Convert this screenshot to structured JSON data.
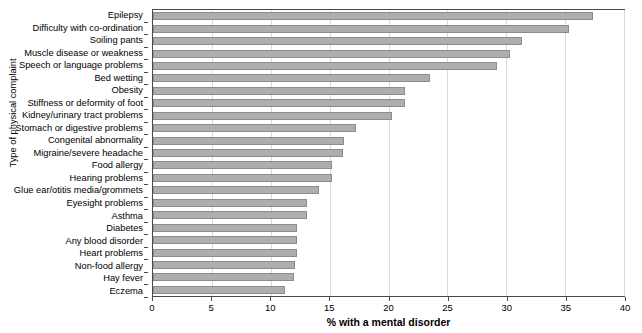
{
  "chart_data": {
    "type": "bar",
    "orientation": "horizontal",
    "title": "",
    "xlabel": "% with a mental disorder",
    "ylabel": "Type of physical complaint",
    "xlim": [
      0,
      40
    ],
    "xticks": [
      0,
      5,
      10,
      15,
      20,
      25,
      30,
      35,
      40
    ],
    "xtick_labels": [
      "0",
      "5",
      "10",
      "15",
      "20",
      "25",
      "30",
      "35",
      "40"
    ],
    "grid": "vertical",
    "legend": "none",
    "bar_color": "#aeaeae",
    "bar_edge_color": "#8d8d8d",
    "categories": [
      "Epilepsy",
      "Difficulty with co-ordination",
      "Soiling pants",
      "Muscle disease or weakness",
      "Speech or language problems",
      "Bed wetting",
      "Obesity",
      "Stiffness or deformity of foot",
      "Kidney/urinary tract problems",
      "Stomach or digestive problems",
      "Congenital abnormality",
      "Migraine/severe headache",
      "Food allergy",
      "Hearing problems",
      "Glue ear/otitis media/grommets",
      "Eyesight problems",
      "Asthma",
      "Diabetes",
      "Any blood disorder",
      "Heart problems",
      "Non-food allergy",
      "Hay fever",
      "Eczema"
    ],
    "values": [
      37.4,
      35.3,
      31.3,
      30.3,
      29.2,
      23.5,
      21.4,
      21.4,
      20.3,
      17.2,
      16.2,
      16.1,
      15.2,
      15.2,
      14.1,
      13.1,
      13.1,
      12.2,
      12.2,
      12.2,
      12.1,
      12.0,
      11.2
    ]
  }
}
